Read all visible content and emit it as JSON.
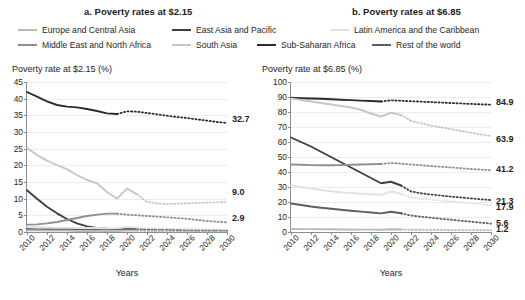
{
  "panels": {
    "a": {
      "title": "a. Poverty rates at $2.15"
    },
    "b": {
      "title": "b. Poverty rates at $6.85"
    }
  },
  "legend": [
    {
      "key": "eca",
      "label": "Europe and Central Asia",
      "color": "#b9b9b9"
    },
    {
      "key": "eap",
      "label": "East Asia and Pacific",
      "color": "#3f3f3f"
    },
    {
      "key": "lac",
      "label": "Latin America and the Caribbean",
      "color": "#e2e2e2"
    },
    {
      "key": "mena",
      "label": "Middle East and North Africa",
      "color": "#8f8f8f"
    },
    {
      "key": "sa",
      "label": "South Asia",
      "color": "#c6c6c6"
    },
    {
      "key": "ssa",
      "label": "Sub-Saharan Africa",
      "color": "#2b2b2b"
    },
    {
      "key": "row",
      "label": "Rest of the world",
      "color": "#5e5e5e"
    }
  ],
  "chart_data": [
    {
      "type": "line",
      "panel": "a",
      "title": "a. Poverty rates at $2.15",
      "ylabel": "Poverty rate at $2.15 (%)",
      "xlabel": "Years",
      "ylim": [
        0,
        45
      ],
      "yticks": [
        0,
        5,
        10,
        15,
        20,
        25,
        30,
        35,
        40,
        45
      ],
      "xlim": [
        2010,
        2030
      ],
      "xticks": [
        2010,
        2012,
        2014,
        2016,
        2018,
        2020,
        2022,
        2024,
        2026,
        2028,
        2030
      ],
      "x": [
        2010,
        2011,
        2012,
        2013,
        2014,
        2015,
        2016,
        2017,
        2018,
        2019,
        2020,
        2021,
        2022,
        2023,
        2024,
        2025,
        2026,
        2027,
        2028,
        2029,
        2030
      ],
      "grid": true,
      "legend_position": "top",
      "projection_note": "dotted segments are projections",
      "series": [
        {
          "name": "Sub-Saharan Africa",
          "key": "ssa",
          "color": "#2b2b2b",
          "solid_until": 2019,
          "values": [
            42.0,
            40.6,
            39.2,
            38.1,
            37.6,
            37.4,
            36.9,
            36.3,
            35.6,
            35.4,
            36.2,
            36.1,
            35.7,
            35.3,
            34.9,
            34.5,
            34.2,
            33.8,
            33.4,
            33.0,
            32.7
          ],
          "end_label": "32.7"
        },
        {
          "name": "South Asia",
          "key": "sa",
          "color": "#c6c6c6",
          "solid_until": 2021,
          "values": [
            25.2,
            23.1,
            21.4,
            20.1,
            18.8,
            17.1,
            15.6,
            14.6,
            12.0,
            10.0,
            13.0,
            11.3,
            9.0,
            8.6,
            8.4,
            8.5,
            8.6,
            8.7,
            8.8,
            8.9,
            9.0
          ],
          "end_label": "9.0"
        },
        {
          "name": "East Asia and Pacific",
          "key": "eap",
          "color": "#3f3f3f",
          "solid_until": 2021,
          "values": [
            12.5,
            10.0,
            7.6,
            5.6,
            3.9,
            2.6,
            1.7,
            1.2,
            1.0,
            0.9,
            1.1,
            1.0,
            0.9,
            0.8,
            0.7,
            0.6,
            0.6,
            0.5,
            0.5,
            0.4,
            0.4
          ],
          "end_label": ""
        },
        {
          "name": "Middle East and North Africa",
          "key": "mena",
          "color": "#8f8f8f",
          "solid_until": 2019,
          "values": [
            2.2,
            2.3,
            2.6,
            3.0,
            3.6,
            4.2,
            4.8,
            5.2,
            5.5,
            5.5,
            5.2,
            5.0,
            4.8,
            4.6,
            4.4,
            4.2,
            4.0,
            3.6,
            3.3,
            3.1,
            2.9
          ],
          "end_label": "2.9"
        },
        {
          "name": "Latin America and the Caribbean",
          "key": "lac",
          "color": "#e2e2e2",
          "solid_until": 2021,
          "values": [
            1.6,
            1.5,
            1.4,
            1.3,
            1.2,
            1.2,
            1.2,
            1.2,
            1.1,
            1.1,
            1.5,
            1.3,
            1.1,
            1.0,
            1.0,
            0.9,
            0.9,
            0.9,
            0.8,
            0.8,
            0.8
          ],
          "end_label": ""
        },
        {
          "name": "Rest of the world",
          "key": "row",
          "color": "#5e5e5e",
          "solid_until": 2021,
          "values": [
            0.9,
            0.8,
            0.8,
            0.7,
            0.7,
            0.6,
            0.6,
            0.6,
            0.5,
            0.5,
            0.7,
            0.6,
            0.6,
            0.5,
            0.5,
            0.5,
            0.4,
            0.4,
            0.4,
            0.4,
            0.3
          ],
          "end_label": ""
        },
        {
          "name": "Europe and Central Asia",
          "key": "eca",
          "color": "#b9b9b9",
          "solid_until": 2021,
          "values": [
            0.5,
            0.5,
            0.4,
            0.4,
            0.4,
            0.3,
            0.3,
            0.3,
            0.3,
            0.3,
            0.4,
            0.4,
            0.3,
            0.3,
            0.3,
            0.2,
            0.2,
            0.2,
            0.2,
            0.2,
            0.2
          ],
          "end_label": ""
        }
      ]
    },
    {
      "type": "line",
      "panel": "b",
      "title": "b. Poverty rates at $6.85",
      "ylabel": "Poverty rate at $6.85 (%)",
      "xlabel": "Years",
      "ylim": [
        0,
        100
      ],
      "yticks": [
        0,
        10,
        20,
        30,
        40,
        50,
        60,
        70,
        80,
        90,
        100
      ],
      "xlim": [
        2010,
        2030
      ],
      "xticks": [
        2010,
        2012,
        2014,
        2016,
        2018,
        2020,
        2022,
        2024,
        2026,
        2028,
        2030
      ],
      "x": [
        2010,
        2011,
        2012,
        2013,
        2014,
        2015,
        2016,
        2017,
        2018,
        2019,
        2020,
        2021,
        2022,
        2023,
        2024,
        2025,
        2026,
        2027,
        2028,
        2029,
        2030
      ],
      "grid": true,
      "legend_position": "top",
      "projection_note": "dotted segments are projections",
      "series": [
        {
          "name": "Sub-Saharan Africa",
          "key": "ssa",
          "color": "#2b2b2b",
          "solid_until": 2019,
          "values": [
            89.5,
            89.2,
            89.0,
            88.8,
            88.5,
            88.2,
            87.9,
            87.6,
            87.3,
            87.0,
            87.8,
            87.5,
            87.2,
            86.9,
            86.6,
            86.3,
            86.0,
            85.7,
            85.4,
            85.1,
            84.9
          ],
          "end_label": "84.9"
        },
        {
          "name": "South Asia",
          "key": "sa",
          "color": "#c6c6c6",
          "solid_until": 2021,
          "values": [
            89.0,
            88.0,
            87.0,
            86.0,
            85.0,
            84.0,
            83.0,
            81.5,
            79.0,
            77.0,
            79.5,
            78.0,
            74.0,
            72.5,
            71.0,
            69.8,
            68.5,
            67.3,
            66.2,
            65.0,
            63.9
          ],
          "end_label": "63.9"
        },
        {
          "name": "East Asia and Pacific",
          "key": "eap",
          "color": "#3f3f3f",
          "solid_until": 2021,
          "values": [
            63.0,
            60.0,
            57.0,
            53.5,
            50.0,
            46.5,
            43.0,
            39.5,
            36.0,
            32.5,
            33.5,
            31.0,
            27.0,
            25.8,
            25.0,
            24.3,
            23.6,
            23.0,
            22.4,
            21.8,
            21.3
          ],
          "end_label": "21.3"
        },
        {
          "name": "Middle East and North Africa",
          "key": "mena",
          "color": "#8f8f8f",
          "solid_until": 2019,
          "values": [
            45.0,
            44.8,
            44.6,
            44.5,
            44.5,
            44.6,
            44.8,
            45.0,
            45.2,
            45.3,
            46.0,
            45.6,
            45.0,
            44.5,
            44.0,
            43.5,
            43.0,
            42.5,
            42.0,
            41.6,
            41.2
          ],
          "end_label": "41.2"
        },
        {
          "name": "Latin America and the Caribbean",
          "key": "lac",
          "color": "#e2e2e2",
          "solid_until": 2021,
          "values": [
            31.0,
            30.0,
            29.0,
            28.0,
            27.2,
            26.5,
            26.0,
            25.6,
            25.2,
            24.8,
            27.0,
            25.5,
            23.0,
            22.2,
            21.6,
            21.0,
            20.4,
            19.8,
            19.2,
            18.5,
            17.9
          ],
          "end_label": "17.9"
        },
        {
          "name": "Rest of the world",
          "key": "row",
          "color": "#5e5e5e",
          "solid_until": 2021,
          "values": [
            19.0,
            18.0,
            17.0,
            16.2,
            15.5,
            14.8,
            14.2,
            13.6,
            13.0,
            12.4,
            13.5,
            12.5,
            11.0,
            10.2,
            9.5,
            8.8,
            8.2,
            7.5,
            6.9,
            6.2,
            5.6
          ],
          "end_label": "5.6"
        },
        {
          "name": "Europe and Central Asia",
          "key": "eca",
          "color": "#b9b9b9",
          "solid_until": 2021,
          "values": [
            2.0,
            1.9,
            1.9,
            1.8,
            1.8,
            1.7,
            1.7,
            1.6,
            1.6,
            1.5,
            1.8,
            1.7,
            1.5,
            1.5,
            1.4,
            1.4,
            1.3,
            1.3,
            1.3,
            1.2,
            1.2
          ],
          "end_label": "1.2"
        }
      ]
    }
  ]
}
